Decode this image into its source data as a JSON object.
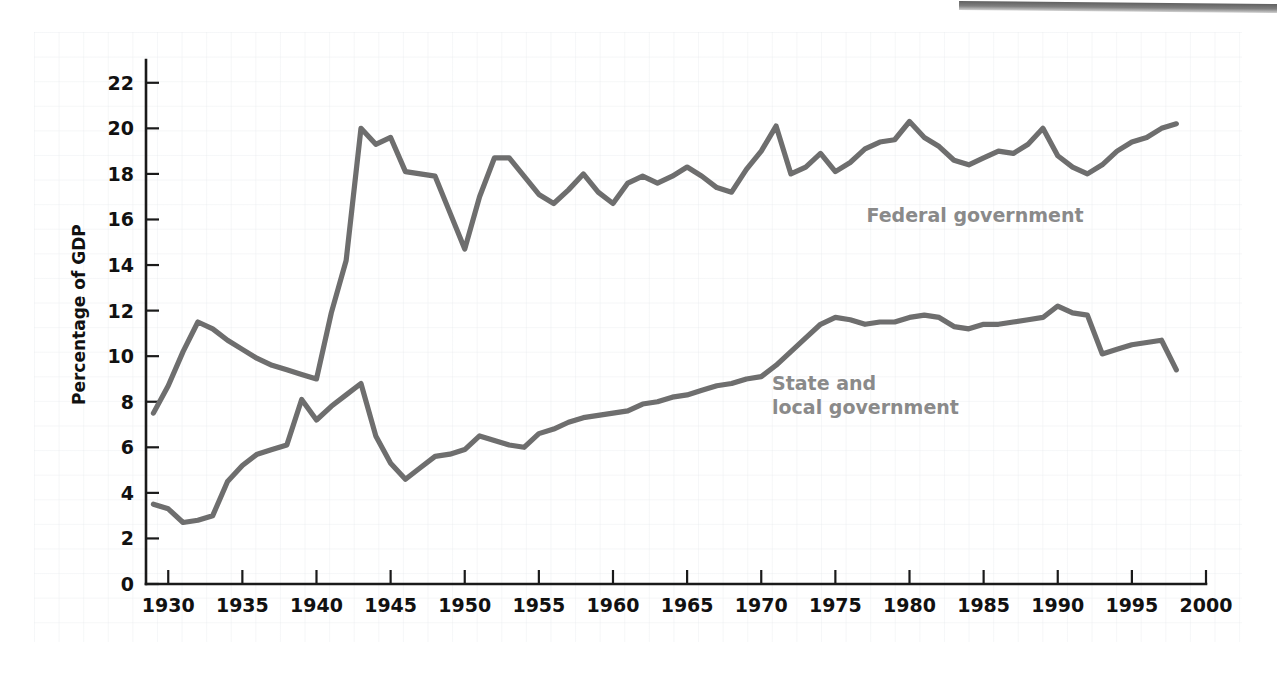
{
  "chart_data": {
    "type": "line",
    "title": "",
    "xlabel": "",
    "ylabel": "Percentage of GDP",
    "xlim": [
      1928.5,
      2000
    ],
    "ylim": [
      0,
      23
    ],
    "xticks": [
      1930,
      1935,
      1940,
      1945,
      1950,
      1955,
      1960,
      1965,
      1970,
      1975,
      1980,
      1985,
      1990,
      1995,
      2000
    ],
    "yticks": [
      0,
      2,
      4,
      6,
      8,
      10,
      12,
      14,
      16,
      18,
      20,
      22
    ],
    "grid": true,
    "grid_style": "graph-paper",
    "legend": "inline-labels",
    "series": [
      {
        "name": "Federal government",
        "color": "#6e6e6e",
        "label_x": 1971.5,
        "label_y": 16.6,
        "x": [
          1929,
          1930,
          1931,
          1932,
          1933,
          1934,
          1935,
          1936,
          1937,
          1938,
          1939,
          1940,
          1941,
          1942,
          1943,
          1944,
          1945,
          1946,
          1947,
          1948,
          1949,
          1950,
          1951,
          1952,
          1953,
          1954,
          1955,
          1956,
          1957,
          1958,
          1959,
          1960,
          1961,
          1962,
          1963,
          1964,
          1965,
          1966,
          1967,
          1968,
          1969,
          1970,
          1971,
          1972,
          1973,
          1974,
          1975,
          1976,
          1977,
          1978,
          1979,
          1980,
          1981,
          1982,
          1983,
          1984,
          1985,
          1986,
          1987,
          1988,
          1989,
          1990,
          1991,
          1992,
          1993,
          1994,
          1995,
          1996,
          1997,
          1998
        ],
        "y": [
          7.5,
          8.7,
          10.2,
          11.5,
          11.2,
          10.7,
          10.3,
          9.9,
          9.6,
          9.4,
          9.2,
          9.0,
          11.9,
          14.2,
          20.0,
          19.3,
          19.6,
          18.1,
          18.0,
          17.9,
          16.3,
          14.7,
          17.0,
          18.7,
          18.7,
          17.9,
          17.1,
          16.7,
          17.3,
          18.0,
          17.2,
          16.7,
          17.6,
          17.9,
          17.6,
          17.9,
          18.3,
          17.9,
          17.4,
          17.2,
          18.2,
          19.0,
          20.1,
          18.0,
          18.3,
          18.9,
          18.1,
          18.5,
          19.1,
          19.4,
          19.5,
          20.3,
          19.6,
          19.2,
          18.6,
          18.4,
          18.7,
          19.0,
          18.9,
          19.3,
          20.0,
          18.8,
          18.3,
          18.0,
          18.4,
          19.0,
          19.4,
          19.6,
          20.0,
          20.2
        ]
      },
      {
        "name": "State and local government",
        "label_line1": "State and",
        "label_line2": "local government",
        "color": "#6e6e6e",
        "label_x": 1971.5,
        "label_y": 9.3,
        "x": [
          1929,
          1930,
          1931,
          1932,
          1933,
          1934,
          1935,
          1936,
          1937,
          1938,
          1939,
          1940,
          1941,
          1942,
          1943,
          1944,
          1945,
          1946,
          1947,
          1948,
          1949,
          1950,
          1951,
          1952,
          1953,
          1954,
          1955,
          1956,
          1957,
          1958,
          1959,
          1960,
          1961,
          1962,
          1963,
          1964,
          1965,
          1966,
          1967,
          1968,
          1969,
          1970,
          1971,
          1972,
          1973,
          1974,
          1975,
          1976,
          1977,
          1978,
          1979,
          1980,
          1981,
          1982,
          1983,
          1984,
          1985,
          1986,
          1987,
          1988,
          1989,
          1990,
          1991,
          1992,
          1993,
          1994,
          1995,
          1996,
          1997,
          1998
        ],
        "y": [
          3.5,
          3.3,
          2.7,
          2.8,
          3.0,
          4.5,
          5.2,
          5.7,
          5.9,
          6.1,
          8.1,
          7.2,
          7.8,
          8.3,
          8.8,
          6.5,
          5.3,
          4.6,
          5.1,
          5.6,
          5.7,
          5.9,
          6.5,
          6.3,
          6.1,
          6.0,
          6.6,
          6.8,
          7.1,
          7.3,
          7.4,
          7.5,
          7.6,
          7.9,
          8.0,
          8.2,
          8.3,
          8.5,
          8.7,
          8.8,
          9.0,
          9.1,
          9.6,
          10.2,
          10.8,
          11.4,
          11.7,
          11.6,
          11.4,
          11.5,
          11.5,
          11.7,
          11.8,
          11.7,
          11.3,
          11.2,
          11.4,
          11.4,
          11.5,
          11.6,
          11.7,
          12.2,
          11.9,
          11.8,
          10.1,
          10.3,
          10.5,
          10.6,
          10.7,
          9.4
        ]
      }
    ]
  },
  "axes": {
    "y_title": "Percentage of GDP",
    "y_tick_labels": [
      "0",
      "2",
      "4",
      "6",
      "8",
      "10",
      "12",
      "14",
      "16",
      "18",
      "20",
      "22"
    ],
    "x_tick_labels": [
      "1930",
      "1935",
      "1940",
      "1945",
      "1950",
      "1955",
      "1960",
      "1965",
      "1970",
      "1975",
      "1980",
      "1985",
      "1990",
      "1995",
      "2000"
    ]
  },
  "labels": {
    "federal": "Federal government",
    "state_local_line1": "State and",
    "state_local_line2": "local government"
  }
}
